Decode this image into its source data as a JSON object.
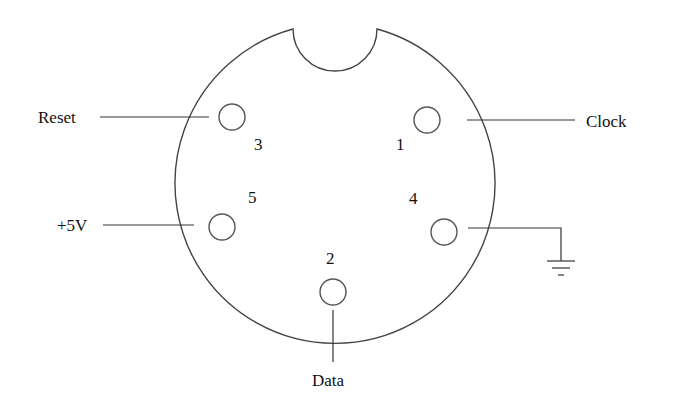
{
  "diagram": {
    "type": "connector-pinout",
    "pins": [
      {
        "number": "1",
        "signal": "Clock",
        "position": "upper-right"
      },
      {
        "number": "2",
        "signal": "Data",
        "position": "bottom"
      },
      {
        "number": "3",
        "signal": "Reset",
        "position": "upper-left"
      },
      {
        "number": "4",
        "signal": "Ground",
        "position": "lower-right",
        "symbol": "ground-icon"
      },
      {
        "number": "5",
        "signal": "+5V",
        "position": "lower-left"
      }
    ],
    "labels": {
      "reset": "Reset",
      "clock": "Clock",
      "vcc": "+5V",
      "data": "Data"
    },
    "numbers": {
      "pin1": "1",
      "pin2": "2",
      "pin3": "3",
      "pin4": "4",
      "pin5": "5"
    },
    "colors": {
      "line": "#444444",
      "text": "#111111",
      "background": "#ffffff"
    }
  }
}
